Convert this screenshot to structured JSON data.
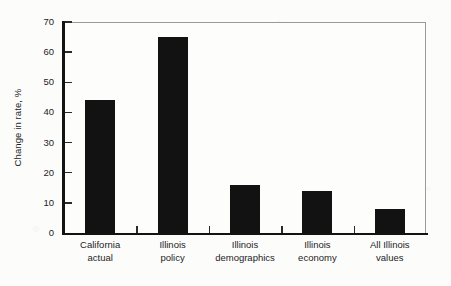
{
  "chart_data": {
    "type": "bar",
    "title": "",
    "xlabel": "",
    "ylabel": "Change in rate, %",
    "categories": [
      "California actual",
      "Illinois policy",
      "Illinois demographics",
      "Illinois economy",
      "All Illinois values"
    ],
    "category_lines": [
      [
        "California",
        "actual"
      ],
      [
        "Illinois",
        "policy"
      ],
      [
        "Illinois",
        "demographics"
      ],
      [
        "Illinois",
        "economy"
      ],
      [
        "All Illinois",
        "values"
      ]
    ],
    "values": [
      44,
      65,
      16,
      14,
      8
    ],
    "ylim": [
      0,
      70
    ],
    "yticks": [
      0,
      10,
      20,
      30,
      40,
      50,
      60,
      70
    ],
    "ytick_labels": [
      "0",
      "10",
      "20",
      "30",
      "40",
      "50",
      "60",
      "70"
    ],
    "grid": false,
    "legend": null,
    "bar_color": "#121212",
    "axis_color": "#131313",
    "frame_color": "#9a9a9a",
    "background_color": "#fcfcfb"
  }
}
